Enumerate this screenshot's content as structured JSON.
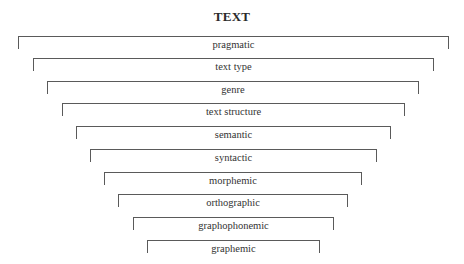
{
  "title": "TEXT",
  "levels": [
    {
      "label": "pragmatic",
      "left": 18,
      "right": 449,
      "top": 36
    },
    {
      "label": "text type",
      "left": 33,
      "right": 434,
      "top": 58
    },
    {
      "label": "genre",
      "left": 47,
      "right": 419,
      "top": 81
    },
    {
      "label": "text structure",
      "left": 62,
      "right": 405,
      "top": 103
    },
    {
      "label": "semantic",
      "left": 76,
      "right": 391,
      "top": 126
    },
    {
      "label": "syntactic",
      "left": 90,
      "right": 377,
      "top": 149
    },
    {
      "label": "morphemic",
      "left": 104,
      "right": 362,
      "top": 172
    },
    {
      "label": "orthographic",
      "left": 118,
      "right": 348,
      "top": 194
    },
    {
      "label": "graphophonemic",
      "left": 133,
      "right": 334,
      "top": 217
    },
    {
      "label": "graphemic",
      "left": 147,
      "right": 320,
      "top": 240
    }
  ],
  "colors": {
    "line": "#5a5a5a",
    "text": "#333333"
  }
}
